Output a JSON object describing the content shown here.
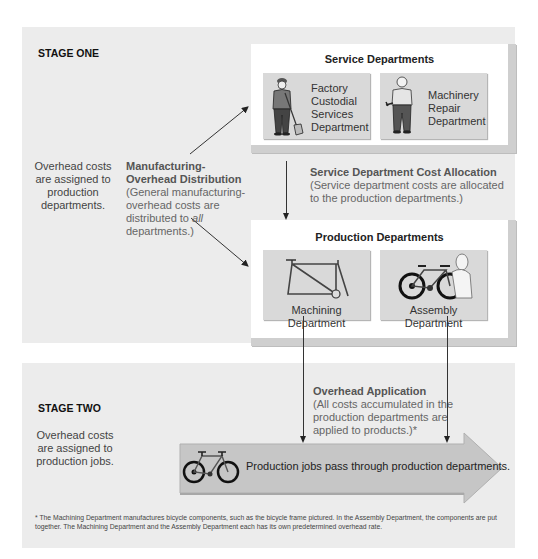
{
  "stage_one": {
    "title": "STAGE ONE",
    "side_note": "Overhead costs are assigned to production departments.",
    "distribution": {
      "heading": "Manufacturing-Overhead Distribution",
      "text_before_italic": " (General manufacturing-overhead costs are distributed to ",
      "italic": "all",
      "text_after_italic": " departments.)"
    },
    "service_departments": {
      "title": "Service Departments",
      "cards": [
        {
          "label_lines": [
            "Factory",
            "Custodial",
            "Services",
            "Department"
          ],
          "icon": "custodian-with-shovel-icon"
        },
        {
          "label_lines": [
            "Machinery",
            "Repair",
            "Department"
          ],
          "icon": "mechanic-with-wrench-icon"
        }
      ]
    },
    "allocation": {
      "heading": "Service Department Cost Allocation",
      "text": "(Service department costs are allocated to the production departments.)"
    },
    "production_departments": {
      "title": "Production Departments",
      "cards": [
        {
          "label": "Machining Department",
          "icon": "bicycle-frame-icon"
        },
        {
          "label": "Assembly Department",
          "icon": "worker-assembling-bicycle-icon"
        }
      ]
    }
  },
  "stage_two": {
    "title": "STAGE TWO",
    "side_note": "Overhead costs are assigned to production jobs.",
    "application": {
      "heading": "Overhead Application",
      "text": "(All costs accumulated in the production departments are applied to products.)*"
    },
    "flow_arrow": {
      "label": "Production jobs pass through production departments.",
      "icon": "bicycle-icon"
    }
  },
  "footnote": "* The Machining Department manufactures bicycle components, such as the bicycle frame pictured. In the Assembly Department, the components are put together. The Machining Department and the Assembly Department each has its own predetermined overhead rate.",
  "colors": {
    "panel_bg": "#ececec",
    "card_bg": "#d9d9d9",
    "box_bg": "#ffffff",
    "arrow_fill": "#c8c8c8",
    "line": "#333333"
  }
}
